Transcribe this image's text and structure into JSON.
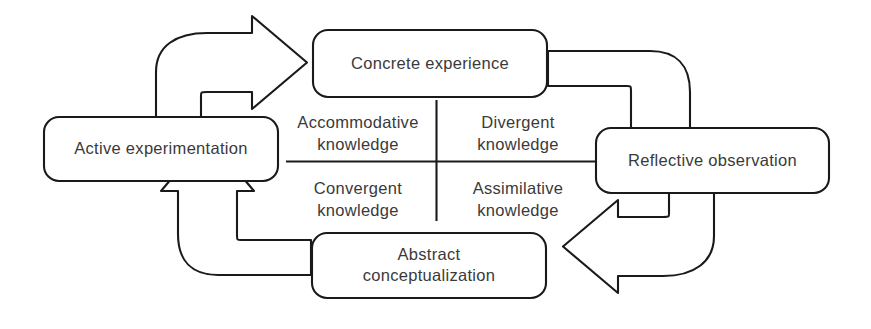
{
  "diagram": {
    "background_color": "#ffffff",
    "line_color": "#1a1a1a",
    "text_color": "#3a3a3a",
    "nodes": [
      {
        "id": "concrete-experience",
        "label": "Concrete experience",
        "position": "top"
      },
      {
        "id": "reflective-observation",
        "label": "Reflective observation",
        "position": "right"
      },
      {
        "id": "abstract-conceptualization",
        "label_line1": "Abstract",
        "label_line2": "conceptualization",
        "position": "bottom"
      },
      {
        "id": "active-experimentation",
        "label": "Active experimentation",
        "position": "left"
      }
    ],
    "quadrants": [
      {
        "id": "accommodative",
        "line1": "Accommodative",
        "line2": "knowledge",
        "position": "top-left"
      },
      {
        "id": "divergent",
        "line1": "Divergent",
        "line2": "knowledge",
        "position": "top-right"
      },
      {
        "id": "convergent",
        "line1": "Convergent",
        "line2": "knowledge",
        "position": "bottom-left"
      },
      {
        "id": "assimilative",
        "line1": "Assimilative",
        "line2": "knowledge",
        "position": "bottom-right"
      }
    ],
    "arrows": [
      {
        "id": "arrow-ae-to-ce",
        "from": "active-experimentation",
        "to": "concrete-experience",
        "style": "hollow-block-curved"
      },
      {
        "id": "arrow-ce-to-ro",
        "from": "concrete-experience",
        "to": "reflective-observation",
        "style": "hollow-block-curved"
      },
      {
        "id": "arrow-ro-to-ac",
        "from": "reflective-observation",
        "to": "abstract-conceptualization",
        "style": "hollow-block-curved"
      },
      {
        "id": "arrow-ac-to-ae",
        "from": "abstract-conceptualization",
        "to": "active-experimentation",
        "style": "hollow-block-curved"
      }
    ]
  }
}
